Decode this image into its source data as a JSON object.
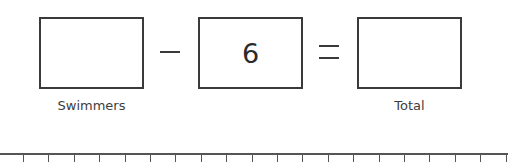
{
  "equation": {
    "boxes": [
      {
        "id": "minuend",
        "value": "",
        "label": "Swimmers"
      },
      {
        "id": "subtrahend",
        "value": "6",
        "label": ""
      },
      {
        "id": "result",
        "value": "",
        "label": "Total"
      }
    ],
    "operators": [
      "minus",
      "equals"
    ]
  },
  "number_line": {
    "tick_count": 20,
    "first_tick_x": 23,
    "tick_spacing": 25.4,
    "labels": []
  },
  "colors": {
    "stroke": "#3a3a3a",
    "text": "#333333",
    "background": "#ffffff"
  }
}
